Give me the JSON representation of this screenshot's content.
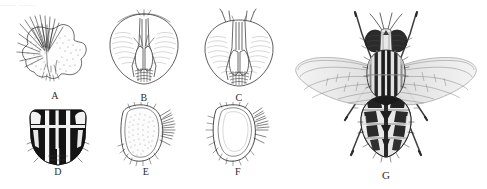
{
  "figure": {
    "type": "scientific-illustration-plate",
    "background_color": "#ffffff",
    "ink_color": "#1a1a1a",
    "width": 487,
    "height": 189,
    "header_text": "....... ......."
  },
  "panels": [
    {
      "label": "A",
      "subject": "abdominal sternite with dense bristles",
      "view": "ventral",
      "shading": "stippled",
      "x": 16,
      "y": 14,
      "w": 78,
      "h": 76
    },
    {
      "label": "B",
      "subject": "head capsule with antennae",
      "view": "anterior",
      "shading": "outline",
      "x": 104,
      "y": 8,
      "w": 80,
      "h": 84
    },
    {
      "label": "C",
      "subject": "head capsule with antennae and arista",
      "view": "anterior",
      "shading": "outline",
      "x": 198,
      "y": 6,
      "w": 82,
      "h": 86
    },
    {
      "label": "D",
      "subject": "thoracic scutum with longitudinal vittae",
      "view": "dorsal",
      "shading": "solid black with pale stripes",
      "x": 26,
      "y": 108,
      "w": 64,
      "h": 58
    },
    {
      "label": "E",
      "subject": "genital plate, stippled, with marginal setae",
      "view": "lateral",
      "shading": "stippled",
      "x": 110,
      "y": 102,
      "w": 72,
      "h": 64
    },
    {
      "label": "F",
      "subject": "genital plate, outline, with marginal setae",
      "view": "lateral",
      "shading": "outline",
      "x": 202,
      "y": 102,
      "w": 72,
      "h": 64
    },
    {
      "label": "G",
      "subject": "whole adult fly, wings spread, striped thorax, tessellated abdomen",
      "view": "dorsal",
      "shading": "halftone",
      "x": 288,
      "y": 4,
      "w": 196,
      "h": 166
    }
  ]
}
